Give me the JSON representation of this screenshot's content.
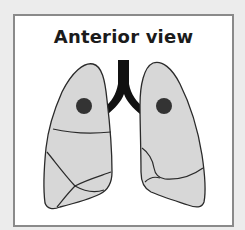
{
  "diagram": {
    "title": "Anterior view",
    "colors": {
      "background": "#ececec",
      "panel": "#ffffff",
      "panel_border": "#8a8a8a",
      "lung_fill": "#d7d7d7",
      "outline": "#2a2a2a",
      "trachea": "#111111",
      "marker": "#333333"
    },
    "elements": [
      {
        "id": "trachea",
        "label": "trachea and main bronchi"
      },
      {
        "id": "right-lung",
        "label": "right lung (viewer's left)",
        "lobes": 3
      },
      {
        "id": "left-lung",
        "label": "left lung (viewer's right)",
        "lobes": 2
      },
      {
        "id": "marker-right",
        "label": "dot marker on right upper lobe"
      },
      {
        "id": "marker-left",
        "label": "dot marker on left upper lobe"
      }
    ]
  }
}
